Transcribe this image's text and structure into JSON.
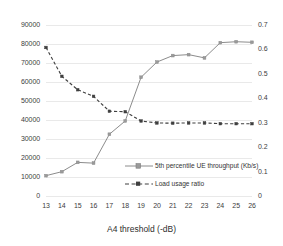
{
  "chart_data": {
    "type": "line",
    "title": "",
    "xlabel": "A4 threshold (-dB)",
    "ylabel": "",
    "y2label": "",
    "x": [
      13,
      14,
      15,
      16,
      17,
      18,
      19,
      20,
      21,
      22,
      23,
      24,
      25,
      26
    ],
    "xtick_labels": [
      "13",
      "14",
      "15",
      "16",
      "17",
      "18",
      "19",
      "20",
      "21",
      "22",
      "23",
      "24",
      "25",
      "26"
    ],
    "xlim": [
      13,
      26
    ],
    "ylim": [
      0,
      90000
    ],
    "ytick_labels": [
      "0",
      "10000",
      "20000",
      "30000",
      "40000",
      "50000",
      "60000",
      "70000",
      "80000",
      "90000"
    ],
    "ytick_values": [
      0,
      10000,
      20000,
      30000,
      40000,
      50000,
      60000,
      70000,
      80000,
      90000
    ],
    "y2lim": [
      0,
      0.7
    ],
    "y2tick_labels": [
      "0",
      "0.1",
      "0.2",
      "0.3",
      "0.4",
      "0.5",
      "0.6",
      "0.7"
    ],
    "y2tick_values": [
      0,
      0.1,
      0.2,
      0.3,
      0.4,
      0.5,
      0.6,
      0.7
    ],
    "grid": true,
    "legend_position": "inside-lower-right",
    "series": [
      {
        "name": "5th percentile UE throughput (Kb/s)",
        "axis": "left",
        "style": "solid",
        "color": "#8c8c8c",
        "marker": "square",
        "values": [
          10700,
          12800,
          17700,
          17300,
          32500,
          39500,
          62500,
          70500,
          73900,
          74400,
          72700,
          80700,
          81200,
          80900
        ]
      },
      {
        "name": "Load usage ratio",
        "axis": "right",
        "style": "dashed",
        "color": "#3f3f3f",
        "marker": "square",
        "values": [
          0.608,
          0.49,
          0.435,
          0.408,
          0.347,
          0.345,
          0.307,
          0.299,
          0.298,
          0.299,
          0.299,
          0.296,
          0.296,
          0.296
        ]
      }
    ]
  },
  "axes": {
    "x_title": "A4 threshold (-dB)"
  },
  "legend": {
    "items": [
      {
        "label": "5th percentile UE throughput (Kb/s)"
      },
      {
        "label": "Load usage ratio"
      }
    ]
  }
}
